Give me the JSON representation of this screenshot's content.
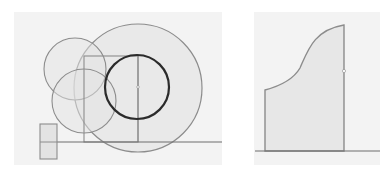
{
  "colors": {
    "page_background": "#ffffff",
    "panel_background": "#f3f3f3",
    "fill_light": "#e3e3e3",
    "stroke_gray": "#8c8c8c",
    "stroke_dark": "#2b2b2b",
    "baseline": "#6e6e6e"
  },
  "figures": [
    {
      "id": "left",
      "description": "Construction of circles, rectangle and baseline",
      "panel": {
        "x": 14,
        "y": 12,
        "w": 208,
        "h": 153
      },
      "large_circle": {
        "cx": 138,
        "cy": 88,
        "r": 64
      },
      "bold_circle": {
        "cx": 137,
        "cy": 87,
        "r": 32
      },
      "upper_left_circle": {
        "cx": 75,
        "cy": 69,
        "r": 31
      },
      "lower_left_circle": {
        "cx": 84,
        "cy": 101,
        "r": 32
      },
      "rectangle": {
        "x": 84,
        "y": 56,
        "w": 54,
        "h": 86
      },
      "center_vertical_line": {
        "x": 138,
        "y1": 56,
        "y2": 142
      },
      "baseline": {
        "y": 142,
        "x1": 40,
        "x2": 222
      },
      "small_rectangle": {
        "x": 40,
        "y": 124,
        "w": 17,
        "h": 35,
        "mid_line_y": 142
      },
      "center_point": {
        "x": 138,
        "y": 87
      }
    },
    {
      "id": "right",
      "description": "Area under curve bounded by two verticals and baseline",
      "panel": {
        "x": 24,
        "y": 12,
        "w": 126,
        "h": 153
      },
      "shape": {
        "left_x": 35,
        "right_x": 114,
        "base_y": 151,
        "left_top_y": 90,
        "right_top_y": 25
      },
      "curve_path": "M35 90 C 50 86, 63 80, 70 68 C 78 50, 84 30, 114 25",
      "baseline": {
        "y": 151,
        "x1": 25,
        "x2": 150
      },
      "marker_point": {
        "x": 114,
        "y": 71
      }
    }
  ]
}
